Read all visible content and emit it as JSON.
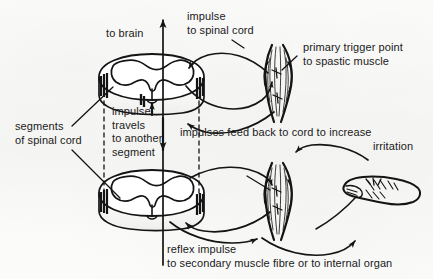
{
  "figure": {
    "kind": "anatomical-line-diagram",
    "ink_color": "#141414",
    "paper_color": "#fbfbfa"
  },
  "labels": {
    "to_brain": "to brain",
    "impulse_to_spinal_cord": "impulse\nto spinal cord",
    "primary_trigger_point": "primary trigger point\nto spastic muscle",
    "segments_of_spinal_cord": "segments\nof spinal cord",
    "impulse_travels": "impulse\ntravels\nto another\nsegment",
    "impulses_feed_back": "impulses feed back to cord to increase",
    "irritation": "irritation",
    "reflex_impulse": "reflex impulse",
    "to_secondary": "to secondary muscle fibre or to internal organ"
  },
  "parts": {
    "cord_upper": "upper spinal cord segment",
    "cord_lower": "lower spinal cord segment",
    "muscle_upper": "spastic muscle with primary trigger point",
    "muscle_lower": "secondary muscle fibre",
    "internal_organ": "internal organ",
    "axis_line": "central ascending/descending tract",
    "dashed_left": "left segment boundary",
    "dashed_right": "right segment boundary"
  }
}
